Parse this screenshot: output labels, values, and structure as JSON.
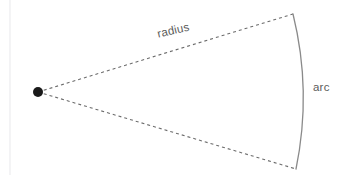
{
  "figure": {
    "background_color": "#ffffff",
    "width": 345,
    "height": 175,
    "labels": {
      "radius": "radius",
      "arc": "arc"
    },
    "colors": {
      "dashed_line": "#6b6b6b",
      "arc_stroke": "#8a8a8a",
      "vertex_dot": "#1a1a1a",
      "text": "#5b5b5b",
      "left_rule": "#f1f1f3"
    },
    "geometry": {
      "vertex": {
        "x": 38,
        "y": 92,
        "radius": 5
      },
      "upper_radius_end": {
        "x": 293,
        "y": 14
      },
      "lower_radius_end": {
        "x": 296,
        "y": 169
      },
      "arc_apex": {
        "x": 303,
        "y": 91
      },
      "dash_pattern": "3 3",
      "left_rule_x": 10
    }
  }
}
